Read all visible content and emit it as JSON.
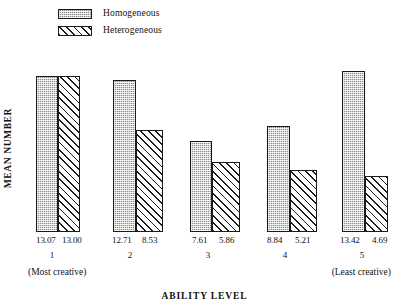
{
  "legend": {
    "items": [
      {
        "label": "Homogeneous",
        "pattern": "dotted-gray",
        "color": "#8a8a8a"
      },
      {
        "label": "Heterogeneous",
        "pattern": "diagonal-hatch",
        "color": "#ffffff"
      }
    ]
  },
  "axes": {
    "ylabel": "MEAN NUMBER",
    "xlabel": "ABILITY LEVEL",
    "x_annotation_left": "(Most creative)",
    "x_annotation_right": "(Least creative)"
  },
  "chart_data": {
    "type": "bar",
    "title": "",
    "xlabel": "ABILITY LEVEL",
    "ylabel": "MEAN NUMBER",
    "categories": [
      "1",
      "2",
      "3",
      "4",
      "5"
    ],
    "category_annotations": {
      "1": "(Most creative)",
      "5": "(Least creative)"
    },
    "ylim": [
      0,
      14.2
    ],
    "grid": false,
    "legend_position": "top-left",
    "series": [
      {
        "name": "Homogeneous",
        "values": [
          13.07,
          12.71,
          7.61,
          8.84,
          13.42
        ],
        "value_labels": [
          "13.07",
          "12.71",
          "7.61",
          "8.84",
          "13.42"
        ]
      },
      {
        "name": "Heterogeneous",
        "values": [
          13.0,
          8.53,
          5.86,
          5.21,
          4.69
        ],
        "value_labels": [
          "13.00",
          "8.53",
          "5.86",
          "5.21",
          "4.69"
        ]
      }
    ]
  },
  "geometry": {
    "baseline_y": 232,
    "plot_top_y": 62,
    "groups": [
      {
        "homo_left": 36,
        "homo_width": 22,
        "hetero_left": 58,
        "hetero_width": 22
      },
      {
        "homo_left": 113,
        "homo_width": 23,
        "hetero_left": 136,
        "hetero_width": 27
      },
      {
        "homo_left": 190,
        "homo_width": 22,
        "hetero_left": 212,
        "hetero_width": 28
      },
      {
        "homo_left": 267,
        "homo_width": 23,
        "hetero_left": 290,
        "hetero_width": 27
      },
      {
        "homo_left": 342,
        "homo_width": 23,
        "hetero_left": 365,
        "hetero_width": 23
      }
    ],
    "value_label_positions": [
      {
        "homo_x": 36,
        "hetero_x": 62
      },
      {
        "homo_x": 112,
        "hetero_x": 142
      },
      {
        "homo_x": 192,
        "hetero_x": 219
      },
      {
        "homo_x": 267,
        "hetero_x": 295
      },
      {
        "homo_x": 340,
        "hetero_x": 372
      }
    ],
    "group_label_x": [
      52,
      130,
      208,
      285,
      362
    ]
  }
}
